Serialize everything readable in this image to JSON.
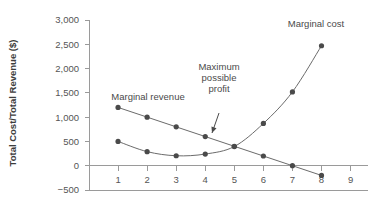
{
  "chart_data": {
    "type": "line",
    "title": "",
    "xlabel": "",
    "ylabel": "Total Cost/Total Revenue ($)",
    "xlim": [
      0,
      9.6
    ],
    "ylim": [
      -500,
      3000
    ],
    "grid": false,
    "legend_position": "inline-annotations",
    "x_ticks": [
      1,
      2,
      3,
      4,
      5,
      6,
      7,
      8,
      9
    ],
    "x_tick_labels": [
      "1",
      "2",
      "3",
      "4",
      "5",
      "6",
      "7",
      "8",
      "9"
    ],
    "y_ticks": [
      -500,
      0,
      500,
      1000,
      1500,
      2000,
      2500,
      3000
    ],
    "y_tick_labels": [
      "−500",
      "0",
      "500",
      "1,000",
      "1,500",
      "2,000",
      "2,500",
      "3,000"
    ],
    "x": [
      1,
      2,
      3,
      4,
      5,
      6,
      7,
      8
    ],
    "series": [
      {
        "name": "Marginal revenue",
        "values": [
          1200,
          1000,
          800,
          600,
          400,
          200,
          0,
          -200
        ],
        "color": "#4a4a4a"
      },
      {
        "name": "Marginal cost",
        "values": [
          500,
          290,
          205,
          240,
          395,
          870,
          1520,
          2470
        ],
        "color": "#4a4a4a"
      }
    ],
    "annotations": [
      {
        "name": "marginal-revenue-label",
        "text": "Marginal revenue",
        "lines": [
          "Marginal revenue"
        ],
        "x_px": 148,
        "y_px": 100
      },
      {
        "name": "marginal-cost-label",
        "text": "Marginal cost",
        "lines": [
          "Marginal cost"
        ],
        "x_px": 316,
        "y_px": 27
      },
      {
        "name": "maximum-possible-profit-label",
        "text": "Maximum possible profit",
        "lines": [
          "Maximum",
          "possible",
          "profit"
        ],
        "x_px": 219,
        "y_px": 70,
        "arrow_from_px": [
          219,
          113
        ],
        "arrow_to_px": [
          212,
          133
        ]
      }
    ]
  },
  "axis_titles": {
    "y": "Total Cost/Total Revenue ($)"
  }
}
